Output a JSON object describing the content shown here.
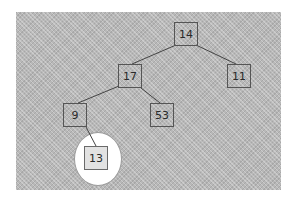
{
  "tree": {
    "nodes": [
      {
        "id": "n14",
        "value": "14",
        "x": 174,
        "y": 22
      },
      {
        "id": "n17",
        "value": "17",
        "x": 118,
        "y": 64
      },
      {
        "id": "n11",
        "value": "11",
        "x": 227,
        "y": 64
      },
      {
        "id": "n9",
        "value": "9",
        "x": 63,
        "y": 103
      },
      {
        "id": "n53",
        "value": "53",
        "x": 150,
        "y": 103
      },
      {
        "id": "n13",
        "value": "13",
        "x": 84,
        "y": 146,
        "highlighted": true
      }
    ],
    "edges": [
      {
        "from": "14",
        "to": "17"
      },
      {
        "from": "14",
        "to": "11"
      },
      {
        "from": "17",
        "to": "9"
      },
      {
        "from": "17",
        "to": "53"
      },
      {
        "from": "9",
        "to": "13"
      }
    ],
    "highlighted_node": "13"
  },
  "colors": {
    "background": "#b8b8b8",
    "node_border": "#555555",
    "edge": "#444444",
    "highlight_fill": "#ffffff"
  }
}
